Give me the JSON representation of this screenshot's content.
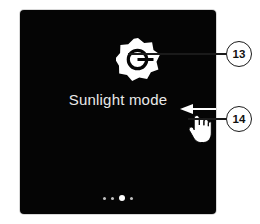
{
  "device": {
    "screen_background": "#050505",
    "title": "Sunlight mode",
    "icon_name": "brightness-sunlight-icon",
    "page_indicator": {
      "total": 4,
      "active_index": 2,
      "dots": [
        {
          "active": false
        },
        {
          "active": false
        },
        {
          "active": true
        },
        {
          "active": false
        }
      ]
    }
  },
  "gesture": {
    "arrow_name": "swipe-left-arrow",
    "arrow_direction": "left",
    "hand_name": "pointing-hand-cursor"
  },
  "callouts": [
    {
      "id": "13",
      "label": "13",
      "target": "sunlight-icon"
    },
    {
      "id": "14",
      "label": "14",
      "target": "swipe-gesture"
    }
  ],
  "colors": {
    "ink": "#1a1a1a",
    "paper": "#ffffff",
    "screen": "#050505",
    "title_text": "#e9e9e9"
  }
}
